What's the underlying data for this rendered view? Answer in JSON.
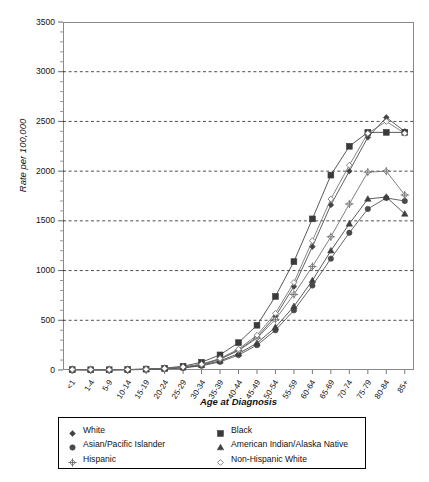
{
  "chart_data": {
    "type": "line",
    "title": "",
    "xlabel": "Age at Diagnosis",
    "ylabel": "Rate per 100,000",
    "ylim": [
      0,
      3500
    ],
    "ytick_interval": 500,
    "yticks": [
      0,
      500,
      1000,
      1500,
      2000,
      2500,
      3000,
      3500
    ],
    "grid": true,
    "grid_style": "dashed-horizontal",
    "legend_position": "below-plot",
    "categories": [
      "<1",
      "1-4",
      "5-9",
      "10-14",
      "15-19",
      "20-24",
      "25-29",
      "30-34",
      "35-39",
      "40-44",
      "45-49",
      "50-54",
      "55-59",
      "60-64",
      "65-69",
      "70-74",
      "75-79",
      "80-84",
      "85+"
    ],
    "series": [
      {
        "name": "White",
        "marker": "filled-diamond",
        "color": "#444444",
        "values": [
          4,
          3,
          3,
          4,
          7,
          14,
          28,
          55,
          110,
          200,
          330,
          540,
          840,
          1240,
          1660,
          2000,
          2340,
          2540,
          2400
        ]
      },
      {
        "name": "Black",
        "marker": "filled-square",
        "color": "#3a3a3a",
        "values": [
          4,
          3,
          3,
          5,
          9,
          18,
          38,
          78,
          152,
          275,
          450,
          740,
          1090,
          1520,
          1960,
          2250,
          2390,
          2390,
          2390
        ]
      },
      {
        "name": "Asian/Pacific Islander",
        "marker": "filled-circle",
        "color": "#4a4a4a",
        "values": [
          3,
          2,
          2,
          3,
          5,
          10,
          21,
          42,
          82,
          150,
          250,
          400,
          600,
          850,
          1120,
          1380,
          1620,
          1730,
          1700
        ]
      },
      {
        "name": "American Indian/Alaska Native",
        "marker": "filled-triangle",
        "color": "#3f3f3f",
        "values": [
          3,
          2,
          2,
          3,
          6,
          12,
          24,
          48,
          92,
          165,
          270,
          430,
          640,
          900,
          1200,
          1470,
          1720,
          1740,
          1570
        ]
      },
      {
        "name": "Hispanic",
        "marker": "cross-diamond",
        "color": "#6a6a6a",
        "values": [
          4,
          3,
          3,
          4,
          7,
          14,
          28,
          56,
          108,
          195,
          320,
          510,
          760,
          1040,
          1340,
          1670,
          1990,
          2000,
          1760
        ]
      },
      {
        "name": "Non-Hispanic White",
        "marker": "open-diamond",
        "color": "#6f6f6f",
        "values": [
          4,
          3,
          3,
          4,
          7,
          15,
          30,
          58,
          116,
          210,
          350,
          570,
          880,
          1300,
          1720,
          2060,
          2380,
          2500,
          2380
        ]
      }
    ]
  },
  "axis": {
    "y_title": "Rate per 100,000",
    "x_title": "Age at Diagnosis"
  },
  "legend": {
    "items": [
      {
        "label": "White",
        "marker": "filled-diamond"
      },
      {
        "label": "Black",
        "marker": "filled-square"
      },
      {
        "label": "Asian/Pacific Islander",
        "marker": "filled-circle"
      },
      {
        "label": "American Indian/Alaska Native",
        "marker": "filled-triangle"
      },
      {
        "label": "Hispanic",
        "marker": "cross-diamond"
      },
      {
        "label": "Non-Hispanic White",
        "marker": "open-diamond"
      }
    ]
  }
}
